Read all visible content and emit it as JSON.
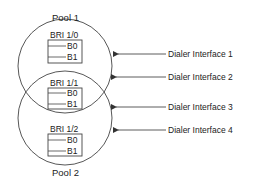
{
  "diagram": {
    "pools": [
      {
        "label": "Pool 1"
      },
      {
        "label": "Pool 2"
      }
    ],
    "bri_interfaces": [
      {
        "label": "BRI 1/0",
        "channels": [
          "B0",
          "B1"
        ]
      },
      {
        "label": "BRI 1/1",
        "channels": [
          "B0",
          "B1"
        ]
      },
      {
        "label": "BRI 1/2",
        "channels": [
          "B0",
          "B1"
        ]
      }
    ],
    "dialer_interfaces": [
      {
        "label": "Dialer Interface 1"
      },
      {
        "label": "Dialer Interface 2"
      },
      {
        "label": "Dialer Interface 3"
      },
      {
        "label": "Dialer Interface 4"
      }
    ],
    "colors": {
      "line": "#333333",
      "background": "#ffffff"
    }
  }
}
